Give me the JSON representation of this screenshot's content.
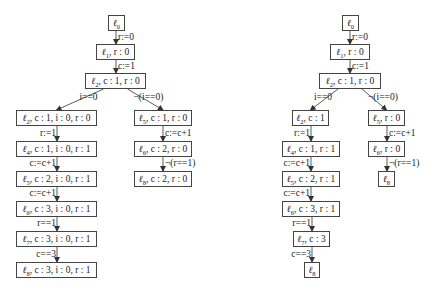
{
  "diagrams": [
    {
      "name": "left-tree",
      "nodes": [
        {
          "id": "n0",
          "label": "ℓ0",
          "x": 108,
          "y": 15,
          "w": 17
        },
        {
          "id": "n1",
          "label": "ℓ1, r : 0",
          "x": 96,
          "y": 44,
          "w": 39
        },
        {
          "id": "n2",
          "label": "ℓ2, c : 1, r : 0",
          "x": 85,
          "y": 73,
          "w": 61
        },
        {
          "id": "n3",
          "label": "ℓ2, c : 1, i : 0, r : 0",
          "x": 16,
          "y": 110,
          "w": 81
        },
        {
          "id": "n4",
          "label": "ℓ4, c : 1, i : 0, r : 1",
          "x": 16,
          "y": 141,
          "w": 81
        },
        {
          "id": "n5",
          "label": "ℓ5, c : 2, i : 0, r : 1",
          "x": 16,
          "y": 171,
          "w": 81
        },
        {
          "id": "n6",
          "label": "ℓ6, c : 3, i : 0, r : 1",
          "x": 16,
          "y": 201,
          "w": 81
        },
        {
          "id": "n7",
          "label": "ℓ7, c : 3, i : 0, r : 1",
          "x": 16,
          "y": 231,
          "w": 81
        },
        {
          "id": "n8",
          "label": "ℓ8, c : 3, i : 0, r : 1",
          "x": 16,
          "y": 262,
          "w": 81
        },
        {
          "id": "n9",
          "label": "ℓ5, c : 1, r : 0",
          "x": 134,
          "y": 110,
          "w": 58
        },
        {
          "id": "n10",
          "label": "ℓ6, c : 2, r : 0",
          "x": 134,
          "y": 141,
          "w": 58
        },
        {
          "id": "n11",
          "label": "ℓ8, c : 2, r : 0",
          "x": 134,
          "y": 171,
          "w": 58
        }
      ],
      "edges": [
        {
          "from": "n0",
          "to": "n1",
          "label": "r:=0"
        },
        {
          "from": "n1",
          "to": "n2",
          "label": "c:=1"
        },
        {
          "from": "n2",
          "to": "n3",
          "label": "i==0"
        },
        {
          "from": "n2",
          "to": "n9",
          "label": "¬(i==0)"
        },
        {
          "from": "n3",
          "to": "n4",
          "label": "r:=1"
        },
        {
          "from": "n4",
          "to": "n5",
          "label": "c:=c+1"
        },
        {
          "from": "n5",
          "to": "n6",
          "label": "c:=c+1"
        },
        {
          "from": "n6",
          "to": "n7",
          "label": "r==1"
        },
        {
          "from": "n7",
          "to": "n8",
          "label": "c==3"
        },
        {
          "from": "n9",
          "to": "n10",
          "label": "c:=c+1"
        },
        {
          "from": "n10",
          "to": "n11",
          "label": "¬(r==1)"
        }
      ]
    },
    {
      "name": "right-tree",
      "nodes": [
        {
          "id": "m0",
          "label": "ℓ0",
          "x": 342,
          "y": 15,
          "w": 17
        },
        {
          "id": "m1",
          "label": "ℓ1, r : 0",
          "x": 330,
          "y": 44,
          "w": 40
        },
        {
          "id": "m2",
          "label": "ℓ2, c : 1, r : 0",
          "x": 319,
          "y": 73,
          "w": 62
        },
        {
          "id": "m3",
          "label": "ℓ2, c : 1",
          "x": 292,
          "y": 110,
          "w": 37
        },
        {
          "id": "m4",
          "label": "ℓ4, c : 1, r : 1",
          "x": 282,
          "y": 141,
          "w": 58
        },
        {
          "id": "m5",
          "label": "ℓ5, c : 2, r : 1",
          "x": 282,
          "y": 171,
          "w": 58
        },
        {
          "id": "m6",
          "label": "ℓ6, c : 3, r : 1",
          "x": 282,
          "y": 201,
          "w": 58
        },
        {
          "id": "m7",
          "label": "ℓ7, c : 3",
          "x": 293,
          "y": 231,
          "w": 37
        },
        {
          "id": "m8",
          "label": "ℓ8",
          "x": 304,
          "y": 262,
          "w": 16
        },
        {
          "id": "m9",
          "label": "ℓ5, r : 0",
          "x": 368,
          "y": 110,
          "w": 37
        },
        {
          "id": "m10",
          "label": "ℓ6, r : 0",
          "x": 368,
          "y": 141,
          "w": 37
        },
        {
          "id": "m11",
          "label": "ℓ8",
          "x": 378,
          "y": 171,
          "w": 17
        }
      ],
      "edges": [
        {
          "from": "m0",
          "to": "m1",
          "label": "r:=0"
        },
        {
          "from": "m1",
          "to": "m2",
          "label": "c:=1"
        },
        {
          "from": "m2",
          "to": "m3",
          "label": "i==0"
        },
        {
          "from": "m2",
          "to": "m9",
          "label": "¬(i==0)"
        },
        {
          "from": "m3",
          "to": "m4",
          "label": "r:=1"
        },
        {
          "from": "m4",
          "to": "m5",
          "label": "c:=c+1"
        },
        {
          "from": "m5",
          "to": "m6",
          "label": "c:=c+1"
        },
        {
          "from": "m6",
          "to": "m7",
          "label": "r==1"
        },
        {
          "from": "m7",
          "to": "m8",
          "label": "c==3"
        },
        {
          "from": "m9",
          "to": "m10",
          "label": "c:=c+1"
        },
        {
          "from": "m10",
          "to": "m11",
          "label": "¬(r==1)"
        }
      ]
    }
  ]
}
